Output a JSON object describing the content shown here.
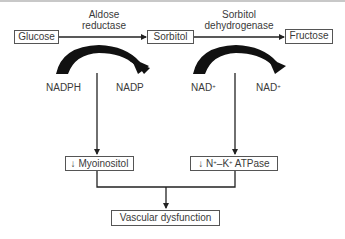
{
  "diagram": {
    "nodes": {
      "glucose": "Glucose",
      "sorbitol": "Sorbitol",
      "fructose": "Fructose",
      "myoinositol": "Myoinositol",
      "atpase_prefix": "N",
      "atpase_sup1": "+",
      "atpase_mid": "–K",
      "atpase_sup2": "+",
      "atpase_suffix": " ATPase",
      "decrease_symbol": "↓",
      "vascular": "Vascular dysfunction"
    },
    "enzymes": {
      "aldose_line1": "Aldose",
      "aldose_line2": "reductase",
      "sdh_line1": "Sorbitol",
      "sdh_line2": "dehydrogenase"
    },
    "cofactors": {
      "nadph": "NADPH",
      "nadp": "NADP",
      "nad_in": "NAD",
      "nad_in_sup": "+",
      "nad_out": "NAD",
      "nad_out_sup": "+"
    },
    "colors": {
      "line": "#222222",
      "box_border": "#555555",
      "text": "#3a3a3a"
    }
  }
}
